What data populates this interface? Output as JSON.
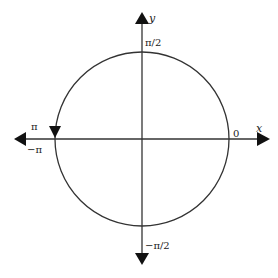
{
  "diagram": {
    "type": "unit-circle-angles",
    "colors": {
      "stroke": "#333333",
      "background": "#ffffff"
    },
    "axes": {
      "x_label": "x",
      "y_label": "y"
    },
    "labels": {
      "zero": "0",
      "pi_half": "π/2",
      "neg_pi_half": "−π/2",
      "pi": "π",
      "neg_pi": "−π"
    },
    "circle": {
      "direction": "counterclockwise",
      "arrow_position": "at angle π, pointing down"
    }
  }
}
